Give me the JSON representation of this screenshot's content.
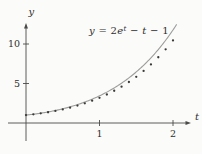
{
  "figure": {
    "equation": {
      "parts": [
        {
          "text": "y",
          "italic": true,
          "sup": false
        },
        {
          "text": " = 2",
          "italic": false,
          "sup": false
        },
        {
          "text": "e",
          "italic": true,
          "sup": false
        },
        {
          "text": "t",
          "italic": true,
          "sup": true
        },
        {
          "text": " − ",
          "italic": false,
          "sup": false
        },
        {
          "text": "t",
          "italic": true,
          "sup": false
        },
        {
          "text": " − 1",
          "italic": false,
          "sup": false
        }
      ]
    },
    "axes": {
      "x_label": "t",
      "y_label": "y"
    },
    "colors": {
      "axis": "#4a4a4a",
      "curve": "#9c9c9c",
      "dots": "#3a3a3a",
      "text": "#2e2e2e",
      "background": "#fbfbf9"
    }
  },
  "chart_data": {
    "type": "line",
    "xlabel": "t",
    "ylabel": "y",
    "xlim": [
      0,
      2.3
    ],
    "ylim": [
      0,
      12.6
    ],
    "x_ticks": [
      1,
      2
    ],
    "y_ticks": [
      5,
      10
    ],
    "grid": false,
    "legend": "none",
    "series": [
      {
        "name": "exact solution y = 2e^t - t - 1",
        "type": "line",
        "formula_coeffs": {
          "exp_coef": 2,
          "t_coef": -1,
          "const": -1
        },
        "t_range": [
          0,
          2.05
        ],
        "color": "#9c9c9c"
      },
      {
        "name": "Euler approximation points (h = 0.1)",
        "type": "scatter",
        "x": [
          0,
          0.1,
          0.2,
          0.3,
          0.4,
          0.5,
          0.6,
          0.7,
          0.8,
          0.9,
          1.0,
          1.1,
          1.2,
          1.3,
          1.4,
          1.5,
          1.6,
          1.7,
          1.8,
          1.9,
          2.0
        ],
        "y": [
          1.0,
          1.1,
          1.22,
          1.36,
          1.53,
          1.72,
          1.94,
          2.2,
          2.49,
          2.82,
          3.19,
          3.61,
          4.08,
          4.6,
          5.19,
          5.85,
          6.59,
          7.41,
          8.32,
          9.33,
          10.45
        ],
        "color": "#3a3a3a",
        "dot_radius": 1.15
      }
    ]
  }
}
